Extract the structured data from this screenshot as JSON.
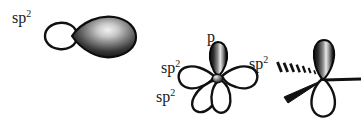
{
  "figure": {
    "width": 361,
    "height": 121,
    "background_color": "#ffffff",
    "ink_color": "#1a1a1a"
  },
  "panels": [
    {
      "id": "single-sp2-orbital",
      "name": "single sp2 hybrid orbital",
      "labels": [
        {
          "id": "sp2-single",
          "base": "sp",
          "sup": "2",
          "x": 12,
          "y": 10
        }
      ],
      "orbitals": [
        {
          "id": "sp2-lobe-large",
          "kind": "sp2-hybrid",
          "fill": "gradient-dark",
          "direction": "right"
        },
        {
          "id": "sp2-lobe-small",
          "kind": "sp2-back-lobe",
          "fill": "white",
          "direction": "left"
        }
      ]
    },
    {
      "id": "sp2-hybridized-atom",
      "name": "sp2 hybridized atom with p orbital and three sp2 orbitals",
      "labels": [
        {
          "id": "p-top",
          "base": "p",
          "sup": "",
          "x": 207,
          "y": 30
        },
        {
          "id": "sp2-left",
          "base": "sp",
          "sup": "2",
          "x": 161,
          "y": 61
        },
        {
          "id": "sp2-right",
          "base": "sp",
          "sup": "2",
          "x": 249,
          "y": 57
        },
        {
          "id": "sp2-lower-left",
          "base": "sp",
          "sup": "2",
          "x": 156,
          "y": 90
        }
      ],
      "orbitals": [
        {
          "id": "p-orbital-up",
          "kind": "p",
          "fill": "gradient-dark",
          "direction": "up"
        },
        {
          "id": "sp2-orbital-left",
          "kind": "sp2-hybrid",
          "fill": "white",
          "direction": "left"
        },
        {
          "id": "sp2-orbital-right",
          "kind": "sp2-hybrid",
          "fill": "white",
          "direction": "right"
        },
        {
          "id": "sp2-orbital-down",
          "kind": "sp2-hybrid",
          "fill": "white",
          "direction": "down"
        },
        {
          "id": "nucleus",
          "kind": "nucleus",
          "fill": "gradient-dark",
          "direction": "center"
        }
      ]
    },
    {
      "id": "sp2-bonding-geometry",
      "name": "sp2 center with wedge and hash bonds",
      "labels": [],
      "orbitals": [
        {
          "id": "p-orbital-up-2",
          "kind": "p",
          "fill": "gradient-dark",
          "direction": "up"
        },
        {
          "id": "p-orbital-down-2",
          "kind": "p-back-lobe",
          "fill": "white",
          "direction": "down"
        }
      ],
      "bonds": [
        {
          "id": "bond-plain",
          "kind": "plain-line",
          "direction": "right"
        },
        {
          "id": "bond-hash",
          "kind": "hashed-wedge",
          "direction": "upper-left",
          "hash_count": 7
        },
        {
          "id": "bond-wedge",
          "kind": "solid-wedge",
          "direction": "lower-left"
        }
      ]
    }
  ]
}
